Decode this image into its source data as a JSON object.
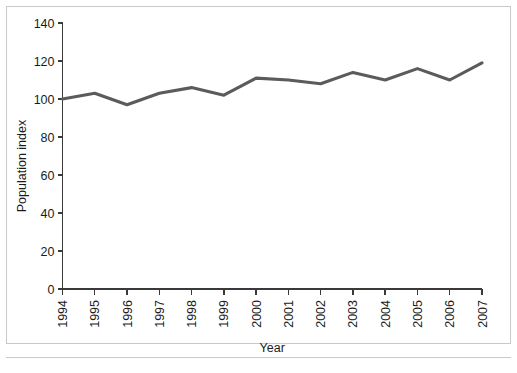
{
  "chart_data": {
    "type": "line",
    "title": "",
    "subtitle": "",
    "xlabel": "Year",
    "ylabel": "Population index",
    "categories": [
      "1994",
      "1995",
      "1996",
      "1997",
      "1998",
      "1999",
      "2000",
      "2001",
      "2002",
      "2003",
      "2004",
      "2005",
      "2006",
      "2007"
    ],
    "values": [
      100,
      103,
      97,
      103,
      106,
      102,
      111,
      110,
      108,
      114,
      110,
      116,
      110,
      119
    ],
    "series": [
      {
        "name": "Population index",
        "values": [
          100,
          103,
          97,
          103,
          106,
          102,
          111,
          110,
          108,
          114,
          110,
          116,
          110,
          119
        ]
      }
    ],
    "ylim": [
      0,
      140
    ],
    "yticks": [
      0,
      20,
      40,
      60,
      80,
      100,
      120,
      140
    ],
    "ytick_labels": [
      "0",
      "20",
      "40",
      "60",
      "80",
      "100",
      "120",
      "140"
    ],
    "xtick_labels": [
      "1994",
      "1995",
      "1996",
      "1997",
      "1998",
      "1999",
      "2000",
      "2001",
      "2002",
      "2003",
      "2004",
      "2005",
      "2006",
      "2007"
    ],
    "xtick_rotation": 90,
    "grid": false,
    "legend": null,
    "legend_position": "none",
    "line_color": "#5b5b5b",
    "axis_color": "#3a3a3a",
    "text_color": "#1b1b1b",
    "background_color": "#ffffff",
    "frame_color": "#c9c9c9"
  }
}
